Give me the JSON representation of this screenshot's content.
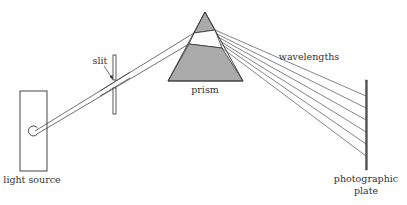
{
  "diagram": {
    "type": "prism spectrometer schematic",
    "labels": {
      "light_source": "light source",
      "slit": "slit",
      "prism": "prism",
      "wavelengths": "wavelengths",
      "plate_line1": "photographic",
      "plate_line2": "plate"
    },
    "colors": {
      "stroke": "#333333",
      "prism_fill": "#aaaaaa",
      "background": "#ffffff"
    },
    "components": [
      "light source",
      "slit",
      "prism",
      "photographic plate"
    ],
    "ray_count_out": 6
  }
}
